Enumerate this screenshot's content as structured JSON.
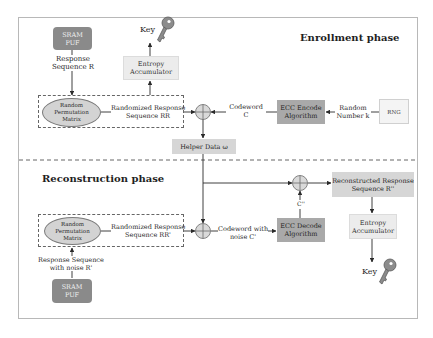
{
  "enrollment": {
    "title": "Enrollment phase",
    "sram_puf": "SRAM PUF",
    "response_label": "Response Sequence R",
    "response_label_l1": "Response",
    "response_label_l2": "Sequence R",
    "permutation": {
      "l1": "Random",
      "l2": "Permutation",
      "l3": "Matrix"
    },
    "randomized_l1": "Randomized Response",
    "randomized_l2": "Sequence RR",
    "entropy_l1": "Entropy",
    "entropy_l2": "Accumulator",
    "key": "Key",
    "codeword_l1": "Codeword",
    "codeword_l2": "C",
    "ecc_encode_l1": "ECC Encode",
    "ecc_encode_l2": "Algorithm",
    "random_l1": "Random",
    "random_l2": "Number k",
    "rng": "RNG",
    "helper_data": "Helper Data  ω"
  },
  "reconstruction": {
    "title": "Reconstruction phase",
    "sram_puf": "SRAM PUF",
    "response_l1": "Response Sequence",
    "response_l2": "with noise R'",
    "permutation": {
      "l1": "Random",
      "l2": "Permutation",
      "l3": "Matrix"
    },
    "randomized_l1": "Randomized Response",
    "randomized_l2": "Sequence RR'",
    "codeword_l1": "Codeword with",
    "codeword_l2": "noise C'",
    "ecc_decode_l1": "ECC Decode",
    "ecc_decode_l2": "Algorithm",
    "c_double_prime": "C''",
    "reconstructed_l1": "Reconstructed Response",
    "reconstructed_l2": "Sequence  R''",
    "entropy_l1": "Entropy",
    "entropy_l2": "Accumulator",
    "key": "Key"
  },
  "colors": {
    "sram_puf": "#8a8a8a",
    "ecc_box": "#a9a9a9",
    "helper_data": "#d6d6d6",
    "entropy": "#ececec",
    "ellipse": "#d3d3d3",
    "line": "#2a2a2a"
  }
}
